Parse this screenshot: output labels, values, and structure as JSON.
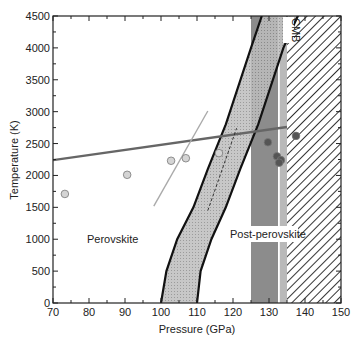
{
  "chart_data": {
    "type": "scatter",
    "title": "",
    "xlabel": "Pressure (GPa)",
    "ylabel": "Temperature (K)",
    "xlim": [
      70,
      150
    ],
    "ylim": [
      0,
      4500
    ],
    "x_ticks": [
      70,
      80,
      90,
      100,
      110,
      120,
      130,
      140,
      150
    ],
    "y_ticks": [
      0,
      500,
      1000,
      1500,
      2000,
      2500,
      3000,
      3500,
      4000,
      4500
    ],
    "grid": false,
    "annotations": [
      {
        "text": "Perovskite",
        "x": 80,
        "y": 1000
      },
      {
        "text": "Post-perovskite",
        "x": 120,
        "y": 1050
      },
      {
        "text": "CMB",
        "x": 134,
        "y": 4200,
        "rotation": 90
      }
    ],
    "regions": [
      {
        "name": "gray-band",
        "x_range": [
          125,
          132.5
        ],
        "color": "#8c8c8c"
      },
      {
        "name": "CMB-band",
        "x_range": [
          133,
          135
        ],
        "color": "#b9b9b9"
      },
      {
        "name": "hatched-core",
        "x_range": [
          135,
          150
        ],
        "pattern": "diagonal-hatch"
      },
      {
        "name": "phase-boundary-band",
        "lower_curve": [
          [
            100,
            0
          ],
          [
            101.5,
            500
          ],
          [
            104.5,
            1000
          ],
          [
            109,
            1500
          ],
          [
            113,
            2100
          ],
          [
            118,
            2800
          ],
          [
            125,
            4000
          ],
          [
            128,
            4500
          ]
        ],
        "upper_curve": [
          [
            110,
            0
          ],
          [
            111,
            500
          ],
          [
            114,
            1000
          ],
          [
            118,
            1500
          ],
          [
            122,
            2100
          ],
          [
            127,
            2800
          ],
          [
            134,
            4000
          ],
          [
            138,
            4500
          ]
        ]
      }
    ],
    "series": [
      {
        "name": "geotherm",
        "style": "thick-line",
        "color": "#666666",
        "points": [
          [
            70,
            2240
          ],
          [
            135,
            2760
          ]
        ]
      },
      {
        "name": "thin-boundary",
        "style": "thin-line",
        "color": "#aaaaaa",
        "points": [
          [
            98,
            1520
          ],
          [
            113,
            3010
          ]
        ]
      },
      {
        "name": "dashed-boundary",
        "style": "dashed-line",
        "color": "#333333",
        "points": [
          [
            113,
            1450
          ],
          [
            121,
            2740
          ]
        ]
      },
      {
        "name": "light-points",
        "style": "circle",
        "color": "#d4d4d4",
        "points": [
          [
            73.3,
            1710
          ],
          [
            90.6,
            2010
          ],
          [
            102.8,
            2230
          ],
          [
            106.9,
            2270
          ],
          [
            116.1,
            2350
          ]
        ]
      },
      {
        "name": "dark-points",
        "style": "circle",
        "color": "#555555",
        "points": [
          [
            129.7,
            2520
          ],
          [
            132.2,
            2300
          ],
          [
            133.3,
            2240
          ],
          [
            132.8,
            2200
          ],
          [
            137.5,
            2620
          ]
        ]
      }
    ]
  },
  "labels": {
    "xlabel": "Pressure (GPa)",
    "ylabel": "Temperature (K)",
    "perovskite": "Perovskite",
    "post_perovskite": "Post-perovskite",
    "cmb": "CMB",
    "x_ticks": [
      "70",
      "80",
      "90",
      "100",
      "110",
      "120",
      "130",
      "140",
      "150"
    ],
    "y_ticks": [
      "0",
      "500",
      "1000",
      "1500",
      "2000",
      "2500",
      "3000",
      "3500",
      "4000",
      "4500"
    ]
  }
}
